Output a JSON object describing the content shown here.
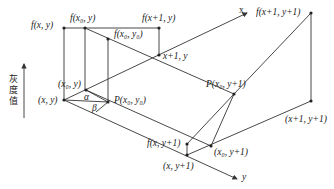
{
  "diagram": {
    "type": "bilinear-interpolation-illustration",
    "axis_labels": {
      "x": "x",
      "y": "y",
      "gray": "灰度值"
    },
    "points": {
      "f_xy": "f(x, y)",
      "f_x0y": "f(x₀, y)",
      "f_x1y": "f(x+1, y)",
      "f_x0y0": "f(x₀, y₀)",
      "x1y": "x+1, y",
      "f_x1y1": "f(x+1, y+1)",
      "p_x0y1": "P(x₀, y+1)",
      "x0y": "(x₀, y)",
      "xy": "(x, y)",
      "p_x0y0": "P(x₀, y₀)",
      "alpha": "α",
      "beta": "β",
      "f_xy1": "f(x, y+1)",
      "x1y1": "(x+1, y+1)",
      "x0y1": "(x₀, y+1)",
      "xy1": "(x, y+1)"
    },
    "colors": {
      "line": "#333333",
      "dot": "#222222"
    }
  }
}
